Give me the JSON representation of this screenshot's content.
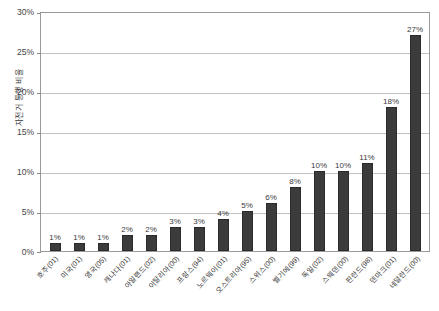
{
  "chart_data": {
    "type": "bar",
    "title": "",
    "xlabel": "",
    "ylabel": "자전거 통행 비율",
    "ylim": [
      0,
      30
    ],
    "yticks": [
      "0%",
      "5%",
      "10%",
      "15%",
      "20%",
      "25%",
      "30%"
    ],
    "ytick_values": [
      0,
      5,
      10,
      15,
      20,
      25,
      30
    ],
    "grid": true,
    "legend": false,
    "bar_color": "#3b3b3b",
    "value_suffix": "%",
    "categories": [
      "호주(01)",
      "미국(01)",
      "영국(05)",
      "캐나다(01)",
      "아일랜드(02)",
      "이탈리아(00)",
      "프랑스(94)",
      "노르웨이(01)",
      "오스트리아(95)",
      "스위스(00)",
      "벨기에(99)",
      "독일(02)",
      "스웨덴(00)",
      "핀란드(98)",
      "덴마크(01)",
      "네덜란드(00)"
    ],
    "values": [
      1,
      1,
      1,
      2,
      2,
      3,
      3,
      4,
      5,
      6,
      8,
      10,
      10,
      11,
      18,
      27
    ],
    "value_labels": [
      "1%",
      "1%",
      "1%",
      "2%",
      "2%",
      "3%",
      "3%",
      "4%",
      "5%",
      "6%",
      "8%",
      "10%",
      "10%",
      "11%",
      "18%",
      "27%"
    ]
  }
}
